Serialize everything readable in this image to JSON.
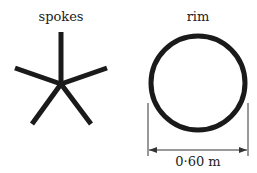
{
  "diagram": {
    "spokes": {
      "label": "spokes",
      "count": 5
    },
    "rim": {
      "label": "rim",
      "diameter_label": "0·60 m"
    },
    "colors": {
      "stroke": "#1a1a1a",
      "text": "#222222"
    }
  }
}
